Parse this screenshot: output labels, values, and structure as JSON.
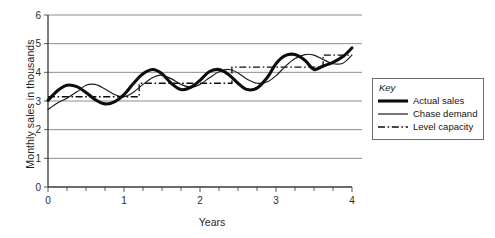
{
  "chart_data": {
    "type": "line",
    "title": "",
    "xlabel": "Years",
    "ylabel": "Monthly sales in thousands",
    "xlim": [
      0,
      4
    ],
    "ylim": [
      0,
      6
    ],
    "grid": true,
    "x_ticks": [
      "0",
      "1",
      "2",
      "3",
      "4"
    ],
    "x_minor_tick_interval": 0.25,
    "y_ticks": [
      "0",
      "1",
      "2",
      "3",
      "4",
      "5",
      "6"
    ],
    "legend_position": "right-outside",
    "legend_title": "Key",
    "series": [
      {
        "name": "Actual sales",
        "style": "thick-solid",
        "color": "#0d0d0d",
        "x": [
          0.0,
          0.12,
          0.25,
          0.38,
          0.5,
          0.62,
          0.75,
          0.88,
          1.0,
          1.12,
          1.25,
          1.38,
          1.5,
          1.62,
          1.75,
          1.88,
          2.0,
          2.12,
          2.25,
          2.38,
          2.5,
          2.62,
          2.75,
          2.88,
          3.0,
          3.12,
          3.25,
          3.38,
          3.5,
          3.62,
          3.75,
          3.88,
          4.0
        ],
        "values": [
          3.02,
          3.35,
          3.55,
          3.5,
          3.3,
          3.05,
          2.9,
          2.98,
          3.22,
          3.6,
          3.95,
          4.1,
          3.95,
          3.62,
          3.4,
          3.48,
          3.72,
          4.02,
          4.1,
          3.92,
          3.62,
          3.4,
          3.45,
          3.8,
          4.3,
          4.58,
          4.62,
          4.42,
          4.1,
          4.22,
          4.35,
          4.55,
          4.85
        ]
      },
      {
        "name": "Chase demand",
        "style": "thin-solid",
        "color": "#1a1a1a",
        "x": [
          0.0,
          0.12,
          0.25,
          0.38,
          0.5,
          0.62,
          0.75,
          0.88,
          1.0,
          1.12,
          1.25,
          1.38,
          1.5,
          1.62,
          1.75,
          1.88,
          2.0,
          2.12,
          2.25,
          2.38,
          2.5,
          2.62,
          2.75,
          2.88,
          3.0,
          3.12,
          3.25,
          3.38,
          3.5,
          3.62,
          3.75,
          3.88,
          4.0
        ],
        "values": [
          2.7,
          2.92,
          3.1,
          3.32,
          3.55,
          3.58,
          3.42,
          3.22,
          3.15,
          3.3,
          3.58,
          3.82,
          3.9,
          3.78,
          3.58,
          3.48,
          3.58,
          3.8,
          4.02,
          4.1,
          3.98,
          3.76,
          3.62,
          3.66,
          3.88,
          4.2,
          4.48,
          4.62,
          4.6,
          4.45,
          4.3,
          4.32,
          4.6
        ]
      },
      {
        "name": "Level capacity",
        "style": "dash-dot",
        "color": "#0d0d0d",
        "steps": [
          {
            "x_start": 0.0,
            "x_end": 1.2,
            "value": 3.15
          },
          {
            "x_start": 1.2,
            "x_end": 2.42,
            "value": 3.62
          },
          {
            "x_start": 2.42,
            "x_end": 3.62,
            "value": 4.18
          },
          {
            "x_start": 3.62,
            "x_end": 4.0,
            "value": 4.6
          }
        ]
      }
    ]
  },
  "legend": {
    "title": "Key",
    "items": [
      {
        "label": "Actual sales",
        "swatch": "thick-solid-line-icon"
      },
      {
        "label": "Chase demand",
        "swatch": "thin-solid-line-icon"
      },
      {
        "label": "Level capacity",
        "swatch": "dash-dot-line-icon"
      }
    ]
  },
  "axes": {
    "x_title": "Years",
    "y_title": "Monthly sales in thousands"
  }
}
